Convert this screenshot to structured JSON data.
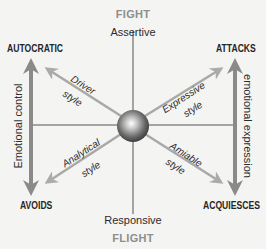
{
  "diagram": {
    "title_top": "FIGHT",
    "title_bottom": "FLIGHT",
    "axis_vertical": {
      "top": "Assertive",
      "bottom": "Responsive"
    },
    "corners": {
      "top_left": "AUTOCRATIC",
      "top_right": "ATTACKS",
      "bottom_left": "AVOIDS",
      "bottom_right": "ACQUIESCES"
    },
    "side_arrows": {
      "left": "Emotional control",
      "right": "emotional expression"
    },
    "styles": {
      "top_left": {
        "name": "Driver",
        "suffix": "style"
      },
      "top_right": {
        "name": "Expressive",
        "suffix": "style"
      },
      "bottom_left": {
        "name": "Analytical",
        "suffix": "style"
      },
      "bottom_right": {
        "name": "Amiable",
        "suffix": "style"
      }
    },
    "colors": {
      "background": "#f4f4f2",
      "axis_line": "#555555",
      "arrow": "#8c8c8c",
      "diag_arrow": "#a9a9a9",
      "pole_text": "#8e8e8e",
      "text": "#2a2a2a"
    }
  }
}
